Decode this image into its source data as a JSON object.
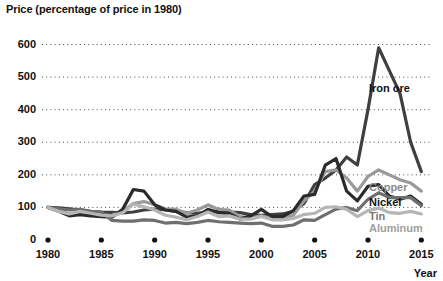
{
  "chart_data": {
    "type": "line",
    "title": "Price (percentage of price in 1980)",
    "xlabel": "Year",
    "ylabel": "",
    "xlim": [
      1980,
      2016
    ],
    "ylim": [
      0,
      620
    ],
    "yticks": [
      0,
      100,
      200,
      300,
      400,
      500,
      600
    ],
    "ytick_labels": [
      "0",
      "100",
      "200",
      "300",
      "400",
      "500",
      "600"
    ],
    "xticks": [
      1980,
      1985,
      1990,
      1995,
      2000,
      2005,
      2010,
      2015
    ],
    "xtick_labels": [
      "1980",
      "1985",
      "1990",
      "1995",
      "2000",
      "2005",
      "2010",
      "2015"
    ],
    "grid": "horizontal-dotted",
    "legend_position": "right-inline-labels",
    "x": [
      1980,
      1981,
      1982,
      1983,
      1984,
      1985,
      1986,
      1987,
      1988,
      1989,
      1990,
      1991,
      1992,
      1993,
      1994,
      1995,
      1996,
      1997,
      1998,
      1999,
      2000,
      2001,
      2002,
      2003,
      2004,
      2005,
      2006,
      2007,
      2008,
      2009,
      2010,
      2011,
      2012,
      2013,
      2014,
      2015
    ],
    "series": [
      {
        "name": "Iron ore",
        "color": "#3f3f3f",
        "label_color": "#111111",
        "values": [
          100,
          99,
          96,
          92,
          88,
          86,
          85,
          83,
          86,
          92,
          95,
          93,
          88,
          84,
          82,
          86,
          88,
          86,
          84,
          78,
          76,
          78,
          80,
          88,
          112,
          170,
          190,
          215,
          255,
          230,
          400,
          590,
          520,
          450,
          300,
          210
        ]
      },
      {
        "name": "Copper",
        "color": "#9a9a9a",
        "label_color": "#8a8a8a",
        "values": [
          100,
          92,
          80,
          84,
          78,
          74,
          76,
          88,
          112,
          118,
          108,
          96,
          94,
          82,
          92,
          108,
          94,
          92,
          72,
          68,
          74,
          66,
          68,
          76,
          120,
          150,
          210,
          215,
          190,
          150,
          195,
          215,
          200,
          185,
          175,
          150
        ]
      },
      {
        "name": "Nickel",
        "color": "#2b2b2b",
        "label_color": "#111111",
        "values": [
          100,
          88,
          74,
          78,
          74,
          72,
          70,
          94,
          155,
          150,
          108,
          92,
          88,
          70,
          74,
          94,
          84,
          82,
          64,
          74,
          94,
          72,
          72,
          90,
          135,
          140,
          230,
          250,
          150,
          120,
          165,
          170,
          135,
          125,
          135,
          110
        ]
      },
      {
        "name": "Tin",
        "color": "#6f6f6f",
        "label_color": "#777777",
        "values": [
          100,
          96,
          92,
          94,
          88,
          86,
          60,
          58,
          58,
          62,
          60,
          52,
          54,
          50,
          54,
          60,
          56,
          54,
          52,
          50,
          52,
          42,
          42,
          46,
          62,
          60,
          78,
          95,
          100,
          90,
          125,
          145,
          130,
          130,
          130,
          105
        ]
      },
      {
        "name": "Aluminum",
        "color": "#b5b5b5",
        "label_color": "#a0a0a0",
        "values": [
          100,
          88,
          80,
          88,
          82,
          76,
          74,
          84,
          110,
          102,
          92,
          76,
          70,
          62,
          72,
          86,
          72,
          74,
          64,
          64,
          72,
          62,
          62,
          66,
          78,
          82,
          100,
          102,
          94,
          72,
          90,
          98,
          84,
          82,
          88,
          80
        ]
      }
    ]
  },
  "axis": {
    "x_title": "Year"
  }
}
